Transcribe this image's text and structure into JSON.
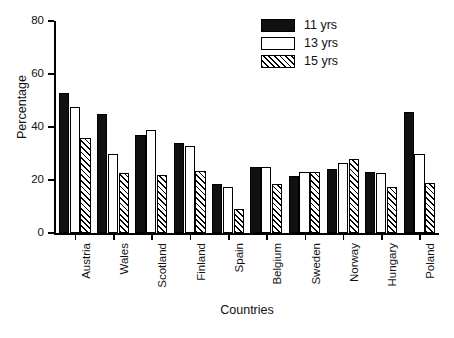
{
  "chart_data": {
    "type": "bar",
    "title": "",
    "xlabel": "Countries",
    "ylabel": "Percentage",
    "ylim": [
      0,
      80
    ],
    "yticks": [
      0,
      20,
      40,
      60,
      80
    ],
    "grid": false,
    "legend_position": "top-right",
    "categories": [
      "Austria",
      "Wales",
      "Scotland",
      "Finland",
      "Spain",
      "Belgium",
      "Sweden",
      "Norway",
      "Hungary",
      "Poland"
    ],
    "series": [
      {
        "name": "11 yrs",
        "style": "solid-black",
        "values": [
          53,
          45,
          37,
          34,
          18.5,
          25,
          21.5,
          24,
          23,
          45.5
        ]
      },
      {
        "name": "13 yrs",
        "style": "open-white",
        "values": [
          47.5,
          30,
          39,
          33,
          17.5,
          25,
          23,
          26.5,
          22.5,
          30
        ]
      },
      {
        "name": "15 yrs",
        "style": "diagonal-hatch",
        "values": [
          36,
          22.5,
          22,
          23.5,
          9,
          18.5,
          23,
          28,
          17.5,
          19
        ]
      }
    ]
  },
  "legend": {
    "entries": [
      {
        "label": "11 yrs",
        "style": "solid"
      },
      {
        "label": "13 yrs",
        "style": "open"
      },
      {
        "label": "15 yrs",
        "style": "hatch"
      }
    ]
  },
  "colors": {
    "bar_solid": "#111111",
    "bar_open": "#ffffff",
    "hatch_line": "#000000",
    "axis": "#000000",
    "text": "#111111",
    "background": "#ffffff"
  }
}
